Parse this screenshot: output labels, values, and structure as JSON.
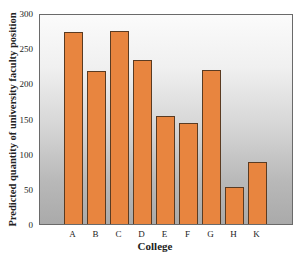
{
  "chart_data": {
    "type": "bar",
    "title": "",
    "xlabel": "College",
    "ylabel": "Predicted quantity of university faculty position",
    "categories": [
      "A",
      "B",
      "C",
      "D",
      "E",
      "F",
      "G",
      "H",
      "K"
    ],
    "values": [
      275,
      219,
      276,
      234,
      155,
      145,
      220,
      53,
      89
    ],
    "ylim": [
      0,
      300
    ],
    "yticks": [
      0,
      50,
      100,
      150,
      200,
      250,
      300
    ],
    "grid": false,
    "legend": null
  },
  "colors": {
    "bar_fill": "#e8853f",
    "bar_border": "#5a3b22",
    "background_top": "#fbfbfb",
    "background_bottom": "#aaaaaa"
  }
}
